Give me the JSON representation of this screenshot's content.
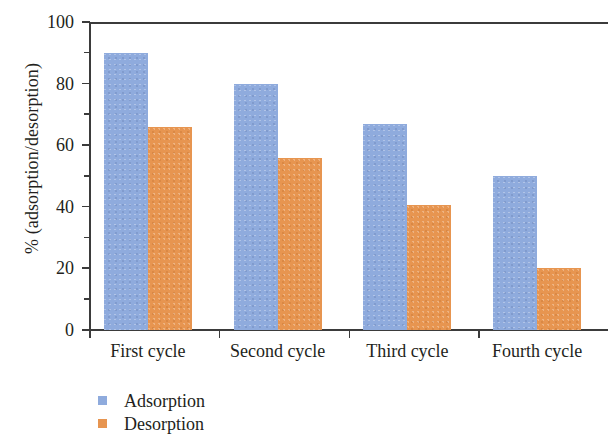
{
  "chart_data": {
    "type": "bar",
    "title": "",
    "subtitle": "",
    "xlabel": "",
    "ylabel": "% (adsorption/desorption)",
    "categories": [
      "First cycle",
      "Second cycle",
      "Third cycle",
      "Fourth cycle"
    ],
    "series": [
      {
        "name": "Adsorption",
        "color": "#8fabdd",
        "values": [
          90,
          80,
          67,
          50
        ]
      },
      {
        "name": "Desorption",
        "color": "#e79550",
        "values": [
          66,
          56,
          40.5,
          20
        ]
      }
    ],
    "ylim": [
      0,
      100
    ],
    "ytick_labels": [
      "100",
      "80",
      "60",
      "40",
      "20",
      "0"
    ],
    "ytick_values": [
      100,
      80,
      60,
      40,
      20,
      0
    ],
    "yminor_values": [
      90,
      70,
      50,
      30,
      10
    ],
    "grid": false,
    "legend_position": "below-left",
    "legend_entries": [
      {
        "label": "Adsorption",
        "color": "#8fabdd"
      },
      {
        "label": "Desorption",
        "color": "#e79550"
      }
    ]
  }
}
